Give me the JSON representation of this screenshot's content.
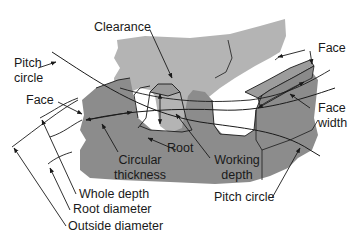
{
  "figure": {
    "colors": {
      "background": "#ffffff",
      "upper_gear": "#b4b4b4",
      "lower_gear": "#8c8c8c",
      "tooth_top_face": "#9a9a9a",
      "line": "#1a1a1a"
    }
  },
  "labels": {
    "clearance": "Clearance",
    "pitch_circle_left_1": "Pitch",
    "pitch_circle_left_2": "circle",
    "face_left": "Face",
    "face_right": "Face",
    "face_width_1": "Face",
    "face_width_2": "width",
    "root": "Root",
    "circular_thickness_1": "Circular",
    "circular_thickness_2": "thickness",
    "working_depth_1": "Working",
    "working_depth_2": "depth",
    "whole_depth": "Whole depth",
    "root_diameter": "Root diameter",
    "outside_diameter": "Outside diameter",
    "pitch_circle_bottom": "Pitch circle"
  }
}
